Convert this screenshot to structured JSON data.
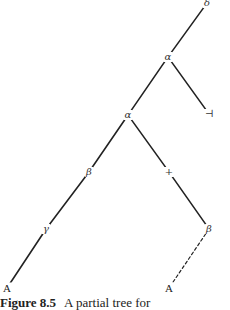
{
  "figure": {
    "number_label": "Figure 8.5",
    "caption_text": "A partial tree for"
  },
  "tree": {
    "nodes": [
      {
        "id": "n0",
        "label": "δ",
        "x": 207,
        "y": 3,
        "kind": "greek"
      },
      {
        "id": "n1",
        "label": "α",
        "x": 168,
        "y": 57,
        "kind": "greek"
      },
      {
        "id": "n2",
        "label": "⊣",
        "x": 209,
        "y": 114,
        "kind": "symbol"
      },
      {
        "id": "n3",
        "label": "α",
        "x": 128,
        "y": 115,
        "kind": "greek"
      },
      {
        "id": "n4",
        "label": "β",
        "x": 89,
        "y": 172,
        "kind": "greek"
      },
      {
        "id": "n5",
        "label": "+",
        "x": 169,
        "y": 172,
        "kind": "symbol"
      },
      {
        "id": "n6",
        "label": "γ",
        "x": 46,
        "y": 229,
        "kind": "greek"
      },
      {
        "id": "n7",
        "label": "β",
        "x": 209,
        "y": 229,
        "kind": "greek"
      },
      {
        "id": "n8",
        "label": "A",
        "x": 7,
        "y": 288,
        "kind": "leaf"
      },
      {
        "id": "n9",
        "label": "A",
        "x": 169,
        "y": 288,
        "kind": "leaf"
      }
    ],
    "edges": [
      {
        "from": "n0",
        "to": "n1",
        "style": "solid"
      },
      {
        "from": "n1",
        "to": "n3",
        "style": "solid"
      },
      {
        "from": "n1",
        "to": "n2",
        "style": "solid"
      },
      {
        "from": "n3",
        "to": "n4",
        "style": "solid"
      },
      {
        "from": "n3",
        "to": "n5",
        "style": "solid"
      },
      {
        "from": "n4",
        "to": "n6",
        "style": "solid"
      },
      {
        "from": "n5",
        "to": "n7",
        "style": "solid"
      },
      {
        "from": "n6",
        "to": "n8",
        "style": "solid"
      },
      {
        "from": "n7",
        "to": "n9",
        "style": "dashed"
      }
    ]
  },
  "colors": {
    "line": "#222222",
    "text": "#333333",
    "background": "#ffffff"
  }
}
